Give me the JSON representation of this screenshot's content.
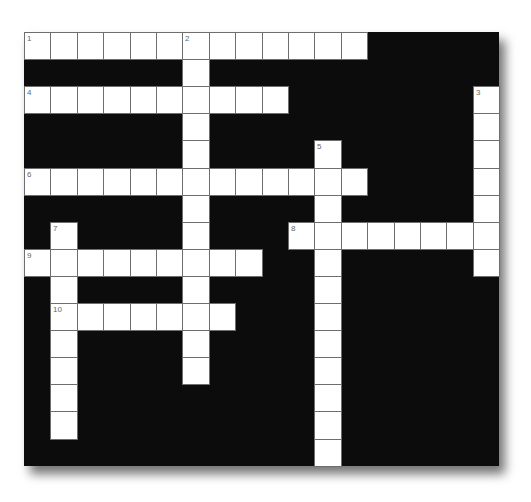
{
  "puzzle": {
    "rows": 16,
    "cols": 18,
    "cell_width": 26.4,
    "cell_height": 27.1,
    "colors": {
      "block": "#0c0c0c",
      "cell": "#ffffff",
      "line": "#6e6e6e",
      "number": "#666666"
    },
    "entries": [
      {
        "number": "1",
        "direction": "across",
        "row": 0,
        "col": 0,
        "length": 13
      },
      {
        "number": "2",
        "direction": "down",
        "row": 0,
        "col": 6,
        "length": 13
      },
      {
        "number": "3",
        "direction": "down",
        "row": 2,
        "col": 17,
        "length": 7
      },
      {
        "number": "4",
        "direction": "across",
        "row": 2,
        "col": 0,
        "length": 10
      },
      {
        "number": "5",
        "direction": "down",
        "row": 4,
        "col": 11,
        "length": 12
      },
      {
        "number": "6",
        "direction": "across",
        "row": 5,
        "col": 0,
        "length": 13
      },
      {
        "number": "7",
        "direction": "down",
        "row": 7,
        "col": 1,
        "length": 8
      },
      {
        "number": "8",
        "direction": "across",
        "row": 7,
        "col": 10,
        "length": 8
      },
      {
        "number": "9",
        "direction": "across",
        "row": 8,
        "col": 0,
        "length": 9
      },
      {
        "number": "10",
        "direction": "across",
        "row": 10,
        "col": 1,
        "length": 7
      }
    ]
  }
}
